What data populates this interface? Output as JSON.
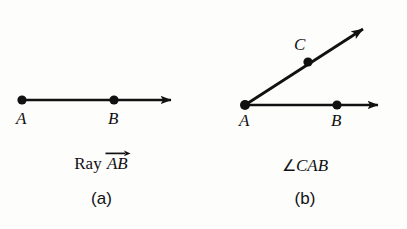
{
  "figure": {
    "background_color": "#fdfdfc",
    "ink_color": "#111111",
    "panels": [
      {
        "id": "a",
        "caption": "(a)",
        "name_prefix": "Ray",
        "name_points": "AB",
        "name_has_vector_arrow": true,
        "points": [
          {
            "label": "A",
            "x": 22,
            "y": 100
          },
          {
            "label": "B",
            "x": 114,
            "y": 100
          }
        ],
        "rays": [
          {
            "from": "A",
            "to_x": 180,
            "to_y": 100,
            "arrowhead": true
          }
        ]
      },
      {
        "id": "b",
        "caption": "(b)",
        "name_symbol": "∠",
        "name_points": "CAB",
        "name_has_vector_arrow": false,
        "points": [
          {
            "label": "A",
            "x": 245,
            "y": 105
          },
          {
            "label": "B",
            "x": 337,
            "y": 105
          },
          {
            "label": "C",
            "x": 308,
            "y": 62
          }
        ],
        "rays": [
          {
            "from": "A",
            "to_x": 387,
            "to_y": 105,
            "arrowhead": true
          },
          {
            "from": "A",
            "to_x": 372,
            "to_y": 22,
            "arrowhead": true
          }
        ]
      }
    ]
  }
}
